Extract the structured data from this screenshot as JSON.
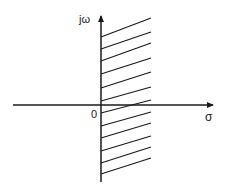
{
  "diagram": {
    "axes": {
      "vertical_label": "jω",
      "horizontal_label": "σ",
      "origin_label": "0"
    },
    "region": {
      "left_boundary": "jω axis (σ = 0)",
      "shading": "hatched",
      "hatch_line_count": 12
    },
    "colors": {
      "stroke": "#1a1a1a",
      "background": "#ffffff"
    }
  }
}
